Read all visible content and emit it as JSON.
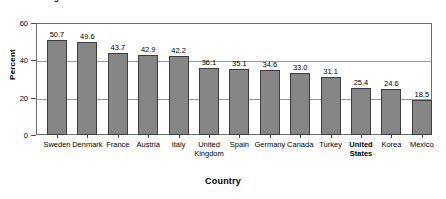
{
  "figure": {
    "title": "Figure 12-1. Tax Revenue as a Percent of GDP",
    "title_clipped": true
  },
  "chart_data": {
    "type": "bar",
    "title": "Figure 12-1. Tax Revenue as a Percent of GDP",
    "xlabel": "Country",
    "ylabel": "Percent",
    "ylim": [
      0,
      60
    ],
    "yticks": [
      0,
      20,
      40,
      60
    ],
    "grid": true,
    "legend": null,
    "bar_color": "#868686",
    "bar_border_color": "#3d3d3d",
    "highlight_category": "United States",
    "categories": [
      "Sweden",
      "Denmark",
      "France",
      "Austria",
      "Italy",
      "United Kingdom",
      "Spain",
      "Germany",
      "Canada",
      "Turkey",
      "United States",
      "Korea",
      "Mexico"
    ],
    "values": [
      50.7,
      49.6,
      43.7,
      42.9,
      42.2,
      36.1,
      35.1,
      34.6,
      33.0,
      31.1,
      25.4,
      24.6,
      18.5
    ]
  }
}
